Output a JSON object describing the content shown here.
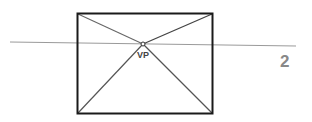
{
  "diagram": {
    "vp_label": "VP",
    "figure_number": "2",
    "colors": {
      "frame": "#1a1a1a",
      "horizon": "#9a9a9a",
      "diagonals": "#555555",
      "figure_number": "#888888"
    }
  }
}
